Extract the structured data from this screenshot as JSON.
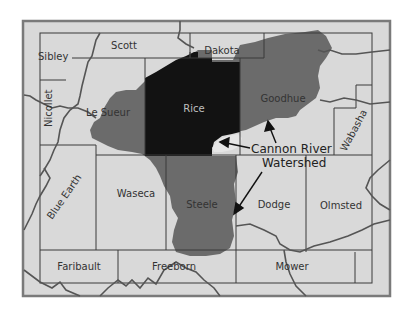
{
  "map": {
    "title": "Cannon River Watershed",
    "colors": {
      "background": "#ffffff",
      "frame_fill": "#d9d9d9",
      "frame_border": "#7a7a7a",
      "county_line": "#3a3a3a",
      "river_line": "#555555",
      "watershed_fill": "#6b6b6b",
      "rice_fill": "#121212",
      "label_text": "#333333",
      "rice_label_text": "#bfbfbf"
    },
    "counties": [
      {
        "name": "Sibley"
      },
      {
        "name": "Scott"
      },
      {
        "name": "Dakota"
      },
      {
        "name": "Nicollet"
      },
      {
        "name": "Le Sueur"
      },
      {
        "name": "Rice"
      },
      {
        "name": "Goodhue"
      },
      {
        "name": "Wabasha"
      },
      {
        "name": "Blue Earth"
      },
      {
        "name": "Waseca"
      },
      {
        "name": "Steele"
      },
      {
        "name": "Dodge"
      },
      {
        "name": "Olmsted"
      },
      {
        "name": "Faribault"
      },
      {
        "name": "Freeborn"
      },
      {
        "name": "Mower"
      }
    ],
    "annotation": {
      "line1": "Cannon River",
      "line2": "Watershed"
    },
    "highlighted": {
      "watershed": "Cannon River Watershed",
      "county": "Rice"
    }
  }
}
